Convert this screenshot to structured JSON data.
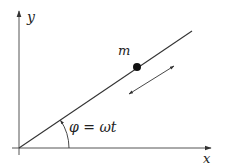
{
  "diagram": {
    "type": "rotating-rod-with-sliding-mass",
    "axes": {
      "x_label": "x",
      "y_label": "y",
      "origin": [
        19,
        148
      ],
      "x_end": [
        212,
        148
      ],
      "y_end": [
        19,
        10
      ]
    },
    "rod": {
      "start": [
        19,
        148
      ],
      "end": [
        192,
        31
      ]
    },
    "mass": {
      "label": "m",
      "center": [
        137,
        67
      ],
      "radius": 4
    },
    "motion_arrow": {
      "start": [
        129,
        94
      ],
      "end": [
        174,
        66
      ],
      "double_headed": true
    },
    "angle": {
      "label": "φ = ωt",
      "arc_radius": 50
    },
    "colors": {
      "line": "#333333",
      "axis": "#555555",
      "mass": "#111111",
      "background": "#ffffff"
    }
  }
}
